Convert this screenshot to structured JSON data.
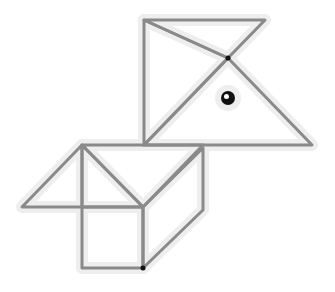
{
  "diagram": {
    "colors": {
      "line": "#8a8a8a",
      "halo": "#eeeeee",
      "dot": "#111111",
      "background": "#ffffff"
    },
    "shapes": [
      {
        "name": "top-right-triangle",
        "points": "144,20 265,20 228,58"
      },
      {
        "name": "top-left-triangle",
        "points": "144,20 228,58 144,145"
      },
      {
        "name": "large-head-triangle",
        "points": "144,145 228,58 312,145"
      },
      {
        "name": "left-wing-triangle",
        "points": "82,145 22,207 82,207"
      },
      {
        "name": "middle-triangle",
        "points": "82,145 143,207 82,207"
      },
      {
        "name": "top-band",
        "points": "82,145 203,145 143,207"
      },
      {
        "name": "square",
        "points": "82,207 143,207 143,268 82,268"
      },
      {
        "name": "parallelogram",
        "points": "143,207 203,148 203,210 143,268"
      }
    ],
    "dots": [
      {
        "name": "joint-dot-top",
        "cx": 228,
        "cy": 58,
        "r": 2.5
      },
      {
        "name": "joint-dot-bottom",
        "cx": 143,
        "cy": 268,
        "r": 2.5
      }
    ],
    "eye": {
      "cx": 228,
      "cy": 98,
      "r": 7
    }
  }
}
